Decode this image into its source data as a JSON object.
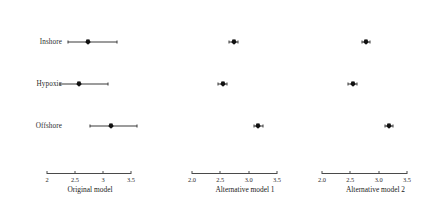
{
  "chart_data": {
    "type": "scatter",
    "title": "",
    "subtitle": "",
    "ylabel": "",
    "grid": false,
    "legend": null,
    "categories": [
      "Inshore",
      "Hypoxic",
      "Offshore"
    ],
    "panels": [
      {
        "id": "panel-original-model",
        "xlabel": "Original model",
        "xlim": [
          2.0,
          3.5
        ],
        "ticks": [
          2.0,
          2.5,
          3.0,
          3.5
        ],
        "ticklabels": [
          "2",
          "2.5",
          "3",
          "3.5"
        ],
        "points": [
          {
            "category": "Inshore",
            "value": 2.73,
            "low": 2.37,
            "high": 3.25
          },
          {
            "category": "Hypoxic",
            "value": 2.57,
            "low": 2.23,
            "high": 3.09
          },
          {
            "category": "Offshore",
            "value": 3.15,
            "low": 2.76,
            "high": 3.6
          }
        ]
      },
      {
        "id": "panel-alternative-model-1",
        "xlabel": "Alternative model 1",
        "xlim": [
          2.0,
          3.5
        ],
        "ticks": [
          2.0,
          2.5,
          3.0,
          3.5
        ],
        "ticklabels": [
          "2.0",
          "2.5",
          "3.0",
          "3.5"
        ],
        "points": [
          {
            "category": "Inshore",
            "value": 2.74,
            "low": 2.66,
            "high": 2.82
          },
          {
            "category": "Hypoxic",
            "value": 2.54,
            "low": 2.46,
            "high": 2.62
          },
          {
            "category": "Offshore",
            "value": 3.17,
            "low": 3.09,
            "high": 3.25
          }
        ]
      },
      {
        "id": "panel-alternative-model-2",
        "xlabel": "Alternative model 2",
        "xlim": [
          2.0,
          3.5
        ],
        "ticks": [
          2.0,
          2.5,
          3.0,
          3.5
        ],
        "ticklabels": [
          "2.0",
          "2.5",
          "3.0",
          "3.5"
        ],
        "points": [
          {
            "category": "Inshore",
            "value": 2.77,
            "low": 2.7,
            "high": 2.85
          },
          {
            "category": "Hypoxic",
            "value": 2.54,
            "low": 2.46,
            "high": 2.62
          },
          {
            "category": "Offshore",
            "value": 3.18,
            "low": 3.11,
            "high": 3.26
          }
        ]
      }
    ],
    "colors": {
      "marker": "#111111",
      "interval": "#3a3a3a",
      "axis": "#4a4a4a",
      "text": "#222222",
      "background": "#ffffff"
    }
  }
}
